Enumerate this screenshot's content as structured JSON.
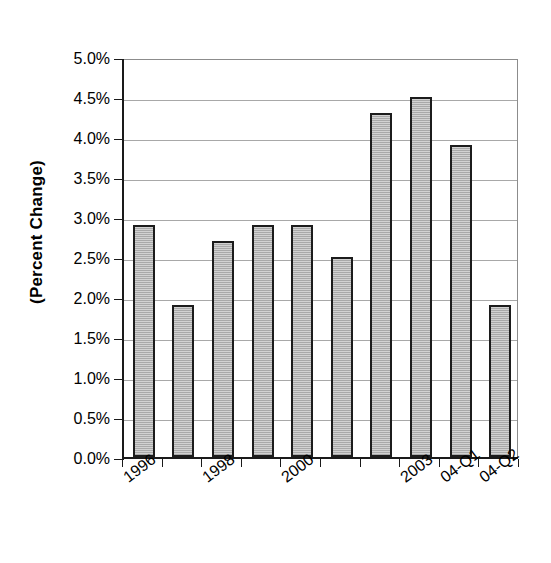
{
  "chart_data": {
    "type": "bar",
    "title": "",
    "xlabel": "",
    "ylabel": "(Percent Change)",
    "ylim": [
      0.0,
      5.0
    ],
    "grid": true,
    "legend": "none",
    "categories": [
      "1996",
      "1997",
      "1998",
      "1999",
      "2000",
      "2001",
      "2003",
      "2003b",
      "04-Q1",
      "04-Q2"
    ],
    "visible_tick_labels": [
      "1996",
      "1998",
      "2000",
      "2003",
      "04-Q1",
      "04-Q2"
    ],
    "bars": [
      {
        "label": "1996",
        "value": 2.9,
        "tick_label": "1996"
      },
      {
        "label": "1997",
        "value": 1.9,
        "tick_label": ""
      },
      {
        "label": "1998",
        "value": 2.7,
        "tick_label": "1998"
      },
      {
        "label": "1999",
        "value": 2.9,
        "tick_label": ""
      },
      {
        "label": "2000",
        "value": 2.9,
        "tick_label": "2000"
      },
      {
        "label": "2001",
        "value": 2.5,
        "tick_label": ""
      },
      {
        "label": "2002",
        "value": 4.3,
        "tick_label": ""
      },
      {
        "label": "2003",
        "value": 4.5,
        "tick_label": "2003"
      },
      {
        "label": "04-Q1",
        "value": 3.9,
        "tick_label": "04-Q1"
      },
      {
        "label": "04-Q2",
        "value": 1.9,
        "tick_label": "04-Q2"
      }
    ],
    "values": [
      2.9,
      1.9,
      2.7,
      2.9,
      2.9,
      2.5,
      4.3,
      4.5,
      3.9,
      1.9
    ],
    "y_ticks": [
      {
        "value": 5.0,
        "label": "5.0%"
      },
      {
        "value": 4.5,
        "label": "4.5%"
      },
      {
        "value": 4.0,
        "label": "4.0%"
      },
      {
        "value": 3.5,
        "label": "3.5%"
      },
      {
        "value": 3.0,
        "label": "3.0%"
      },
      {
        "value": 2.5,
        "label": "2.5%"
      },
      {
        "value": 2.0,
        "label": "2.0%"
      },
      {
        "value": 1.5,
        "label": "1.5%"
      },
      {
        "value": 1.0,
        "label": "1.0%"
      },
      {
        "value": 0.5,
        "label": "0.5%"
      },
      {
        "value": 0.0,
        "label": "0.0%"
      }
    ],
    "colors": {
      "bar_fill": "#c0c0c0",
      "bar_border": "#1c1c1c",
      "gridline": "#a8a8a8",
      "axis": "#1a1a1a",
      "background": "#ffffff"
    }
  },
  "title_cropped_fragment": ""
}
